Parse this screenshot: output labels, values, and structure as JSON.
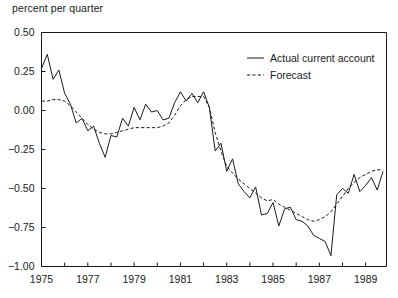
{
  "figure": {
    "axis_note": "percent per quarter",
    "legend": {
      "position": "top-right-inside",
      "entries": [
        {
          "key": "actual",
          "label": "Actual current account",
          "style": "solid"
        },
        {
          "key": "forecast",
          "label": "Forecast",
          "style": "dashed"
        }
      ]
    }
  },
  "chart_data": {
    "type": "line",
    "title": "",
    "subtitle": "",
    "xlabel": "",
    "ylabel": "percent per quarter",
    "xlim": [
      1975.0,
      1989.9
    ],
    "ylim": [
      -1.0,
      0.5
    ],
    "yticks": [
      0.5,
      0.25,
      0.0,
      -0.25,
      -0.5,
      -0.75,
      -1.0
    ],
    "ytick_labels": [
      "0.50",
      "0.25",
      "0.00",
      "-0.25",
      "-0.50",
      "-0.75",
      "-1.00"
    ],
    "xticks": [
      1975,
      1976,
      1977,
      1978,
      1979,
      1980,
      1981,
      1982,
      1983,
      1984,
      1985,
      1986,
      1987,
      1988,
      1989
    ],
    "xtick_labels": [
      "1975",
      "",
      "1977",
      "",
      "1979",
      "",
      "1981",
      "",
      "1983",
      "",
      "1985",
      "",
      "1987",
      "",
      "1989"
    ],
    "grid": false,
    "legend_labels": [
      "Actual current account",
      "Forecast"
    ],
    "x": [
      1975.0,
      1975.25,
      1975.5,
      1975.75,
      1976.0,
      1976.25,
      1976.5,
      1976.75,
      1977.0,
      1977.25,
      1977.5,
      1977.75,
      1978.0,
      1978.25,
      1978.5,
      1978.75,
      1979.0,
      1979.25,
      1979.5,
      1979.75,
      1980.0,
      1980.25,
      1980.5,
      1980.75,
      1981.0,
      1981.25,
      1981.5,
      1981.75,
      1982.0,
      1982.25,
      1982.5,
      1982.75,
      1983.0,
      1983.25,
      1983.5,
      1983.75,
      1984.0,
      1984.25,
      1984.5,
      1984.75,
      1985.0,
      1985.25,
      1985.5,
      1985.75,
      1986.0,
      1986.25,
      1986.5,
      1986.75,
      1987.0,
      1987.25,
      1987.5,
      1987.75,
      1988.0,
      1988.25,
      1988.5,
      1988.75,
      1989.0,
      1989.25,
      1989.5,
      1989.75
    ],
    "series": [
      {
        "name": "Actual current account",
        "style": "solid",
        "values": [
          0.27,
          0.36,
          0.2,
          0.26,
          0.11,
          0.04,
          -0.08,
          -0.05,
          -0.13,
          -0.1,
          -0.21,
          -0.3,
          -0.16,
          -0.17,
          -0.05,
          -0.1,
          0.02,
          -0.06,
          0.04,
          -0.01,
          0.0,
          -0.06,
          -0.05,
          0.05,
          0.12,
          0.06,
          0.11,
          0.05,
          0.12,
          0.02,
          -0.26,
          -0.21,
          -0.39,
          -0.31,
          -0.47,
          -0.52,
          -0.56,
          -0.49,
          -0.67,
          -0.66,
          -0.59,
          -0.74,
          -0.63,
          -0.62,
          -0.7,
          -0.71,
          -0.74,
          -0.8,
          -0.82,
          -0.84,
          -0.93,
          -0.54,
          -0.5,
          -0.53,
          -0.41,
          -0.52,
          -0.48,
          -0.43,
          -0.51,
          -0.39
        ]
      },
      {
        "name": "Forecast",
        "style": "dashed",
        "values": [
          0.06,
          0.06,
          0.07,
          0.07,
          0.06,
          0.03,
          -0.01,
          -0.05,
          -0.09,
          -0.12,
          -0.14,
          -0.15,
          -0.15,
          -0.14,
          -0.13,
          -0.12,
          -0.11,
          -0.11,
          -0.11,
          -0.11,
          -0.11,
          -0.1,
          -0.08,
          -0.03,
          0.03,
          0.07,
          0.09,
          0.09,
          0.09,
          0.02,
          -0.14,
          -0.26,
          -0.36,
          -0.4,
          -0.44,
          -0.47,
          -0.5,
          -0.53,
          -0.56,
          -0.58,
          -0.57,
          -0.6,
          -0.62,
          -0.64,
          -0.66,
          -0.68,
          -0.7,
          -0.71,
          -0.7,
          -0.68,
          -0.65,
          -0.6,
          -0.55,
          -0.5,
          -0.46,
          -0.43,
          -0.41,
          -0.39,
          -0.38,
          -0.38
        ]
      }
    ]
  }
}
